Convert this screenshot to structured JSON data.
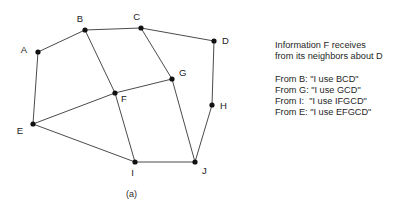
{
  "figure": {
    "background_color": "#ffffff",
    "ink_color": "#1a1a1a"
  },
  "panel_a": {
    "caption": "(a)",
    "graph": {
      "directed": false,
      "node_radius": 2.6,
      "edge_color": "#2b2b2b",
      "node_color": "#111111",
      "nodes": [
        {
          "id": "A",
          "label": "A",
          "x": 38,
          "y": 52,
          "label_dx": -11,
          "label_dy": -2
        },
        {
          "id": "B",
          "label": "B",
          "x": 85,
          "y": 30,
          "label_dx": -2,
          "label_dy": -11
        },
        {
          "id": "C",
          "label": "C",
          "x": 141,
          "y": 28,
          "label_dx": -1,
          "label_dy": -11
        },
        {
          "id": "D",
          "label": "D",
          "x": 214,
          "y": 41,
          "label_dx": 8,
          "label_dy": 0
        },
        {
          "id": "E",
          "label": "E",
          "x": 33,
          "y": 124,
          "label_dx": -10,
          "label_dy": 7
        },
        {
          "id": "F",
          "label": "F",
          "x": 115,
          "y": 93,
          "label_dx": 6,
          "label_dy": 6
        },
        {
          "id": "G",
          "label": "G",
          "x": 172,
          "y": 79,
          "label_dx": 7,
          "label_dy": -6
        },
        {
          "id": "H",
          "label": "H",
          "x": 212,
          "y": 105,
          "label_dx": 8,
          "label_dy": 1
        },
        {
          "id": "I",
          "label": "I",
          "x": 135,
          "y": 162,
          "label_dx": -1,
          "label_dy": 11
        },
        {
          "id": "J",
          "label": "J",
          "x": 195,
          "y": 162,
          "label_dx": 7,
          "label_dy": 9
        }
      ],
      "edges": [
        {
          "from": "A",
          "to": "B"
        },
        {
          "from": "A",
          "to": "E"
        },
        {
          "from": "B",
          "to": "C"
        },
        {
          "from": "B",
          "to": "F"
        },
        {
          "from": "C",
          "to": "D"
        },
        {
          "from": "C",
          "to": "G"
        },
        {
          "from": "D",
          "to": "H"
        },
        {
          "from": "E",
          "to": "F"
        },
        {
          "from": "E",
          "to": "I"
        },
        {
          "from": "F",
          "to": "G"
        },
        {
          "from": "F",
          "to": "I"
        },
        {
          "from": "G",
          "to": "J"
        },
        {
          "from": "H",
          "to": "J"
        },
        {
          "from": "I",
          "to": "J"
        }
      ]
    }
  },
  "panel_b": {
    "caption": "(b)",
    "heading_line_1": "Information F receives",
    "heading_line_2": "from its neighbors about D",
    "messages": [
      "From B: \"I use BCD\"",
      "From G: \"I use GCD\"",
      "From I:  \"I use IFGCD\"",
      "From E: \"I use EFGCD\""
    ]
  }
}
